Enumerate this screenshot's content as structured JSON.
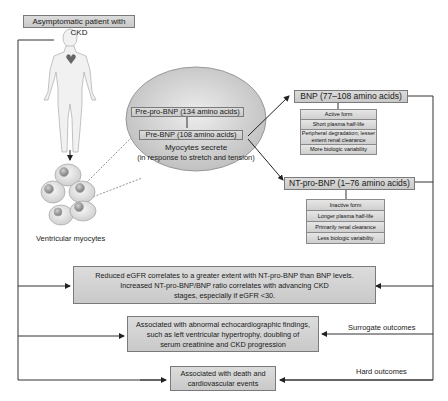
{
  "title": "Asymptomatic patient with CKD",
  "figure": {
    "cells_label": "Ventricular myocytes",
    "ellipse": {
      "prepro": "Pre-pro-BNP (134 amino acids)",
      "pre": "Pre-BNP (108 amino acids)",
      "secrete_line1": "Myocytes secrete",
      "secrete_line2": "(in response to stretch and tension)"
    }
  },
  "bnp": {
    "title": "BNP (77–108 amino acids)",
    "properties": [
      "Active form",
      "Short plasma half-life",
      "Peripheral degradation; lesser extent renal clearance",
      "More biologic variability"
    ]
  },
  "ntprobnp": {
    "title": "NT-pro-BNP (1–76 amino acids)",
    "properties": [
      "Inactive form",
      "Longer plasma half-life",
      "Primarily renal clearance",
      "Less biologic variability"
    ]
  },
  "outcomes": {
    "egfr": {
      "line1": "Reduced eGFR correlates to a greater extent with NT-pro-BNP than BNP levels.",
      "line2": "Increased NT-pro-BNP/BNP ratio correlates with advancing CKD",
      "line3": "stages, especially if eGFR <30."
    },
    "surrogate": {
      "line1": "Associated with abnormal echocardiographic findings,",
      "line2": "such as left ventricular hypertrophy, doubling of",
      "line3": "serum creatinine and CKD progression",
      "side_label": "Surrogate outcomes"
    },
    "hard": {
      "line1": "Associated with death and",
      "line2": "cardiovascular events",
      "side_label": "Hard outcomes"
    }
  },
  "colors": {
    "box_fill": "#d4d4d4",
    "box_border": "#7a7a7a",
    "line": "#333333"
  }
}
